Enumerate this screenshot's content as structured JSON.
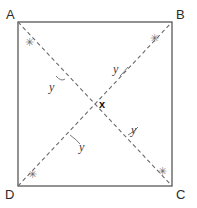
{
  "figure": {
    "background_color": "#ffffff",
    "square": {
      "stroke_color": "#4a4a4a",
      "stroke_width": 1.2,
      "x_left": 18,
      "x_right": 172,
      "y_top": 22,
      "y_bottom": 186
    },
    "diagonals": {
      "stroke_color": "#6b6b6b",
      "stroke_width": 1.1,
      "dash": "4,3",
      "segments": [
        {
          "name": "A-C",
          "x1": 18,
          "y1": 22,
          "x2": 172,
          "y2": 186
        },
        {
          "name": "D-B",
          "x1": 18,
          "y1": 186,
          "x2": 172,
          "y2": 22
        }
      ]
    },
    "center": {
      "x": 95,
      "y": 104
    },
    "vertices": [
      {
        "name": "vertex-a",
        "label": "A",
        "x": 6,
        "y": 8
      },
      {
        "name": "vertex-b",
        "label": "B",
        "x": 176,
        "y": 8
      },
      {
        "name": "vertex-c",
        "label": "C",
        "x": 176,
        "y": 188
      },
      {
        "name": "vertex-d",
        "label": "D",
        "x": 5,
        "y": 188
      }
    ],
    "corner_marks": [
      {
        "name": "angle-mark-a",
        "glyph": "✳",
        "x": 25,
        "y": 37
      },
      {
        "name": "angle-mark-b",
        "glyph": "✳",
        "x": 150,
        "y": 33
      },
      {
        "name": "angle-mark-c",
        "glyph": "✳",
        "x": 158,
        "y": 166
      },
      {
        "name": "angle-mark-d",
        "glyph": "✳",
        "x": 28,
        "y": 169
      }
    ],
    "angle_labels": [
      {
        "name": "angle-label-upper-left",
        "label": "y",
        "x": 49,
        "y": 81
      },
      {
        "name": "angle-label-upper-right",
        "label": "y",
        "x": 113,
        "y": 63
      },
      {
        "name": "angle-label-lower-left",
        "label": "y",
        "x": 79,
        "y": 141
      },
      {
        "name": "angle-label-lower-right",
        "label": "y",
        "x": 131,
        "y": 124
      }
    ],
    "angle_arcs": [
      {
        "name": "arc-upper-left",
        "d": "M 56 76 q 5 6 9 3"
      },
      {
        "name": "arc-upper-right",
        "d": "M 120 76 q 5 -5 8 -9"
      },
      {
        "name": "arc-lower-left",
        "d": "M 70 135 q 7 5 10 9"
      },
      {
        "name": "arc-lower-right",
        "d": "M 128 135 q 6 -3 10 -8"
      }
    ],
    "center_label": {
      "name": "center-angle-label",
      "label": "x",
      "x": 99,
      "y": 99
    }
  }
}
